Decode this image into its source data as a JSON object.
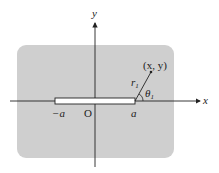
{
  "diagram": {
    "axes": {
      "x_label": "x",
      "y_label": "y",
      "origin_label": "O"
    },
    "bar": {
      "left_label": "−a",
      "right_label": "a"
    },
    "point": {
      "label": "(x, y)"
    },
    "r_label": "r",
    "r_sub": "1",
    "theta_label": "θ",
    "theta_sub": "1",
    "colors": {
      "region": "#cfcfcf",
      "line": "#222222"
    }
  }
}
